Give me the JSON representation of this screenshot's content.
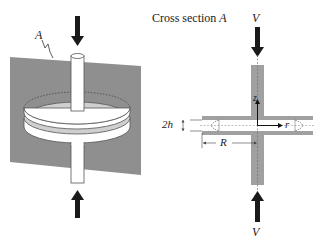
{
  "diagram": {
    "left_view": {
      "plane_label": "A",
      "description": "Two parallel circular disks pierced by a cylindrical rod, cut by vertical plane A"
    },
    "right_view": {
      "title_prefix": "Cross section ",
      "title_var": "A",
      "top_arrow_label": "V",
      "bottom_arrow_label": "V",
      "axis_z": "z",
      "axis_r": "r",
      "gap_label": "2h",
      "radius_label": "R"
    },
    "colors": {
      "plane_gray": "#8f8f8f",
      "rod_gray": "#a0a0a0",
      "arrow": "#1a1a1a",
      "line": "#333333"
    }
  }
}
